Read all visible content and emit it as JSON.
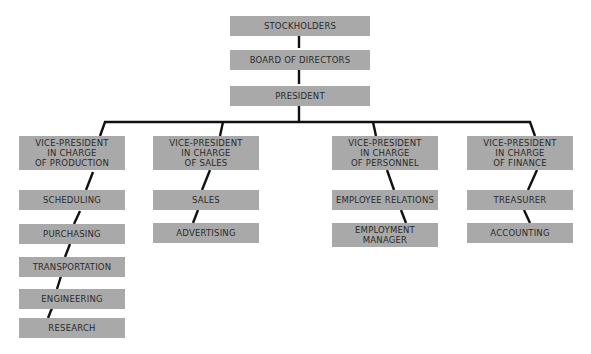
{
  "chart": {
    "top": [
      {
        "id": "stockholders",
        "label": "STOCKHOLDERS"
      },
      {
        "id": "board",
        "label": "BOARD OF DIRECTORS"
      },
      {
        "id": "president",
        "label": "PRESIDENT"
      }
    ],
    "columns": [
      {
        "head": "VICE-PRESIDENT\nIN CHARGE\nOF PRODUCTION",
        "items": [
          "SCHEDULING",
          "PURCHASING",
          "TRANSPORTATION",
          "ENGINEERING",
          "RESEARCH"
        ]
      },
      {
        "head": "VICE-PRESIDENT\nIN CHARGE\nOF SALES",
        "items": [
          "SALES",
          "ADVERTISING"
        ]
      },
      {
        "head": "VICE-PRESIDENT\nIN CHARGE\nOF PERSONNEL",
        "items": [
          "EMPLOYEE RELATIONS",
          "EMPLOYMENT\nMANAGER"
        ]
      },
      {
        "head": "VICE-PRESIDENT\nIN CHARGE\nOF FINANCE",
        "items": [
          "TREASURER",
          "ACCOUNTING"
        ]
      }
    ]
  },
  "colors": {
    "box": "#a9a9a9",
    "line": "#111111",
    "text": "#2a2a2a"
  }
}
